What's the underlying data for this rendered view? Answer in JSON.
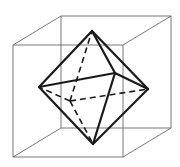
{
  "figure": {
    "colors": {
      "cube_edge": "#555555",
      "octahedron_edge": "#1a1a1a",
      "background": "#ffffff"
    }
  },
  "cube": {
    "back_face": [
      [
        61,
        16
      ],
      [
        171,
        16
      ],
      [
        171,
        128
      ],
      [
        61,
        128
      ]
    ],
    "front_face": [
      [
        13,
        45
      ],
      [
        123,
        45
      ],
      [
        123,
        157
      ],
      [
        13,
        157
      ]
    ]
  },
  "octahedron": {
    "vertices": {
      "top": [
        92,
        31
      ],
      "bottom": [
        93,
        144
      ],
      "left": [
        39,
        87
      ],
      "right": [
        148,
        89
      ],
      "front": [
        115,
        73
      ],
      "back": [
        70,
        101
      ]
    },
    "visible_edges": [
      [
        "top",
        "left"
      ],
      [
        "top",
        "right"
      ],
      [
        "top",
        "front"
      ],
      [
        "bottom",
        "left"
      ],
      [
        "bottom",
        "right"
      ],
      [
        "bottom",
        "front"
      ],
      [
        "left",
        "front"
      ],
      [
        "right",
        "front"
      ]
    ],
    "hidden_edges": [
      [
        "back",
        "left"
      ],
      [
        "back",
        "right"
      ],
      [
        "back",
        "bottom"
      ],
      [
        "back",
        "top"
      ]
    ]
  }
}
